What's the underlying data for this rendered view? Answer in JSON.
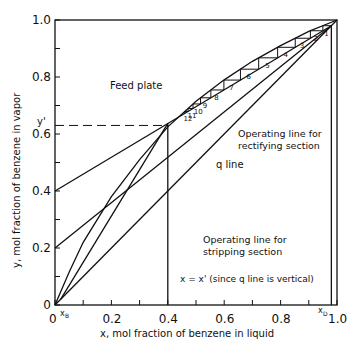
{
  "chart_data": {
    "type": "line",
    "xlabel": "x, mol fraction of benzene in liquid",
    "ylabel": "y, mol fraction of benzene in vapor",
    "xlim": [
      0,
      1.0
    ],
    "ylim": [
      0,
      1.0
    ],
    "x_ticks": [
      "0",
      "0.2",
      "0.4",
      "0.6",
      "0.8",
      "1.0"
    ],
    "y_ticks": [
      "0",
      "0.2",
      "0.4",
      "0.6",
      "0.8",
      "1.0"
    ],
    "x_markers": {
      "xB": 0.02,
      "xD": 0.98,
      "x_prime": 0.4
    },
    "y_marker": {
      "label": "y'",
      "value": 0.63
    },
    "series": [
      {
        "name": "Equilibrium curve",
        "x": [
          0,
          0.05,
          0.1,
          0.2,
          0.3,
          0.4,
          0.5,
          0.6,
          0.7,
          0.8,
          0.9,
          1.0
        ],
        "y": [
          0,
          0.115,
          0.22,
          0.38,
          0.51,
          0.625,
          0.715,
          0.79,
          0.855,
          0.91,
          0.96,
          1.0
        ]
      },
      {
        "name": "Diagonal y=x",
        "x": [
          0,
          1.0
        ],
        "y": [
          0,
          1.0
        ]
      },
      {
        "name": "Operating line for rectifying section",
        "x": [
          0,
          0.98
        ],
        "y": [
          0.4,
          0.98
        ]
      },
      {
        "name": "Operating line for stripping section",
        "x": [
          0.02,
          0.4
        ],
        "y": [
          0.02,
          0.637
        ]
      },
      {
        "name": "Auxiliary line",
        "x": [
          0,
          0.98
        ],
        "y": [
          0.2,
          0.98
        ]
      },
      {
        "name": "q line",
        "x": [
          0.4,
          0.4
        ],
        "y": [
          0,
          0.637
        ]
      }
    ],
    "plates": [
      "1",
      "2",
      "3",
      "4",
      "5",
      "6",
      "7",
      "8",
      "9",
      "10",
      "11",
      "12"
    ],
    "annotations": {
      "feed_plate": "Feed plate",
      "rectifying": [
        "Operating line for",
        "rectifying section"
      ],
      "q_line": "q line",
      "stripping": [
        "Operating line for",
        "stripping section"
      ],
      "vertical_note": "x  = x'  (since q line is vertical)",
      "xB_label": "x",
      "xB_sub": "B",
      "xD_label": "x",
      "xD_sub": "D",
      "y_prime": "y'"
    }
  }
}
